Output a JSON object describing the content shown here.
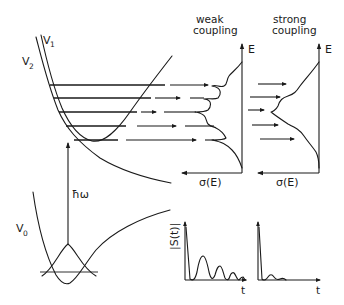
{
  "diagram": {
    "potentials": {
      "v0": {
        "label": "V",
        "subscript": "0"
      },
      "v1": {
        "label": "V",
        "subscript": "1"
      },
      "v2": {
        "label": "V",
        "subscript": "2"
      }
    },
    "excitation": {
      "label": "ħω"
    },
    "panels": {
      "weak": {
        "title_line1": "weak",
        "title_line2": "coupling",
        "y_axis": "E",
        "x_axis": "σ(E)"
      },
      "strong": {
        "title_line1": "strong",
        "title_line2": "coupling",
        "y_axis": "E",
        "x_axis": "σ(E)"
      }
    },
    "autocorrelation": {
      "y_axis": "|S(t)|",
      "weak_x_axis": "t",
      "strong_x_axis": "t"
    },
    "colors": {
      "ink": "#1a1a1a",
      "background": "#ffffff"
    }
  }
}
